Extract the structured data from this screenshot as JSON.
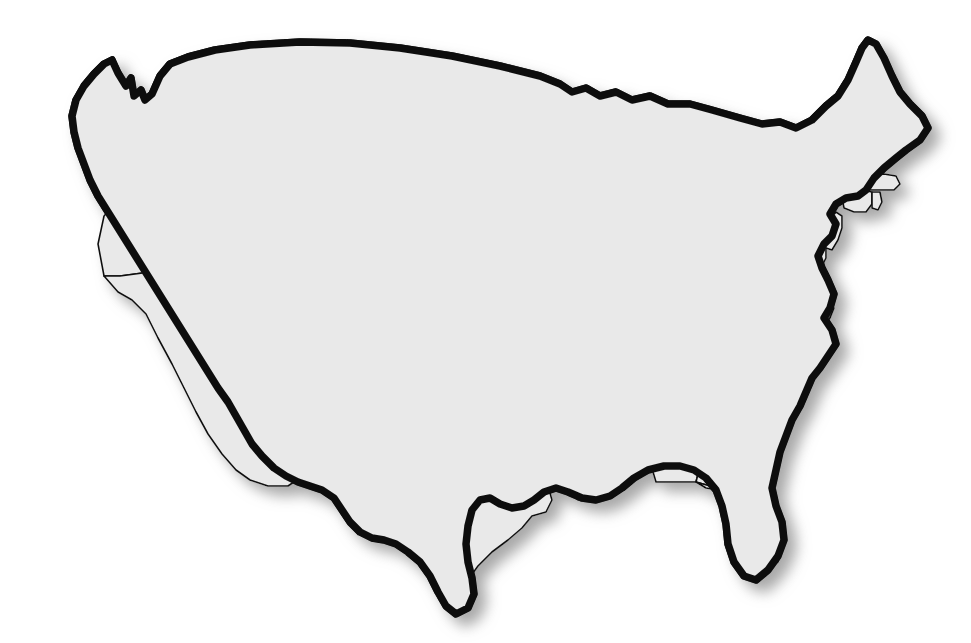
{
  "figure": {
    "kind": "choropleth-locator-map",
    "region": "Contiguous United States",
    "background_color": "#ffffff",
    "width": 971,
    "height": 643,
    "has_title": false,
    "has_legend": false,
    "has_labels": false,
    "title": "",
    "caption": ""
  },
  "style": {
    "state_fill": "#e9e9e9",
    "highlight_fill": "#6a6a6a",
    "lake_fill": "#bdbdbd",
    "border_color": "#111111",
    "outline_color": "#111111",
    "shadow_color": "#9a9a9a",
    "internal_border_width": 1.6,
    "national_border_width": 7.5,
    "shadow_offset_x": 9,
    "shadow_offset_y": 9,
    "shadow_blur": 7
  },
  "highlight": {
    "state_code": "VA",
    "state_name": "Virginia",
    "fill": "#6a6a6a"
  },
  "lakes": [
    {
      "code": "LK-SUPERIOR",
      "name": "Lake Superior"
    },
    {
      "code": "LK-MICHIGAN",
      "name": "Lake Michigan"
    },
    {
      "code": "LK-HURON",
      "name": "Lake Huron"
    },
    {
      "code": "LK-ERIE",
      "name": "Lake Erie"
    },
    {
      "code": "LK-ONTARIO",
      "name": "Lake Ontario"
    }
  ],
  "states": [
    {
      "code": "WA",
      "name": "Washington",
      "highlighted": false
    },
    {
      "code": "OR",
      "name": "Oregon",
      "highlighted": false
    },
    {
      "code": "CA",
      "name": "California",
      "highlighted": false
    },
    {
      "code": "NV",
      "name": "Nevada",
      "highlighted": false
    },
    {
      "code": "ID",
      "name": "Idaho",
      "highlighted": false
    },
    {
      "code": "MT",
      "name": "Montana",
      "highlighted": false
    },
    {
      "code": "WY",
      "name": "Wyoming",
      "highlighted": false
    },
    {
      "code": "UT",
      "name": "Utah",
      "highlighted": false
    },
    {
      "code": "AZ",
      "name": "Arizona",
      "highlighted": false
    },
    {
      "code": "NM",
      "name": "New Mexico",
      "highlighted": false
    },
    {
      "code": "CO",
      "name": "Colorado",
      "highlighted": false
    },
    {
      "code": "ND",
      "name": "North Dakota",
      "highlighted": false
    },
    {
      "code": "SD",
      "name": "South Dakota",
      "highlighted": false
    },
    {
      "code": "NE",
      "name": "Nebraska",
      "highlighted": false
    },
    {
      "code": "KS",
      "name": "Kansas",
      "highlighted": false
    },
    {
      "code": "OK",
      "name": "Oklahoma",
      "highlighted": false
    },
    {
      "code": "TX",
      "name": "Texas",
      "highlighted": false
    },
    {
      "code": "MN",
      "name": "Minnesota",
      "highlighted": false
    },
    {
      "code": "IA",
      "name": "Iowa",
      "highlighted": false
    },
    {
      "code": "MO",
      "name": "Missouri",
      "highlighted": false
    },
    {
      "code": "AR",
      "name": "Arkansas",
      "highlighted": false
    },
    {
      "code": "LA",
      "name": "Louisiana",
      "highlighted": false
    },
    {
      "code": "WI",
      "name": "Wisconsin",
      "highlighted": false
    },
    {
      "code": "IL",
      "name": "Illinois",
      "highlighted": false
    },
    {
      "code": "MI",
      "name": "Michigan",
      "highlighted": false
    },
    {
      "code": "IN",
      "name": "Indiana",
      "highlighted": false
    },
    {
      "code": "OH",
      "name": "Ohio",
      "highlighted": false
    },
    {
      "code": "KY",
      "name": "Kentucky",
      "highlighted": false
    },
    {
      "code": "TN",
      "name": "Tennessee",
      "highlighted": false
    },
    {
      "code": "MS",
      "name": "Mississippi",
      "highlighted": false
    },
    {
      "code": "AL",
      "name": "Alabama",
      "highlighted": false
    },
    {
      "code": "GA",
      "name": "Georgia",
      "highlighted": false
    },
    {
      "code": "FL",
      "name": "Florida",
      "highlighted": false
    },
    {
      "code": "SC",
      "name": "South Carolina",
      "highlighted": false
    },
    {
      "code": "NC",
      "name": "North Carolina",
      "highlighted": false
    },
    {
      "code": "VA",
      "name": "Virginia",
      "highlighted": true
    },
    {
      "code": "WV",
      "name": "West Virginia",
      "highlighted": false
    },
    {
      "code": "MD",
      "name": "Maryland",
      "highlighted": false
    },
    {
      "code": "DE",
      "name": "Delaware",
      "highlighted": false
    },
    {
      "code": "PA",
      "name": "Pennsylvania",
      "highlighted": false
    },
    {
      "code": "NJ",
      "name": "New Jersey",
      "highlighted": false
    },
    {
      "code": "NY",
      "name": "New York",
      "highlighted": false
    },
    {
      "code": "CT",
      "name": "Connecticut",
      "highlighted": false
    },
    {
      "code": "RI",
      "name": "Rhode Island",
      "highlighted": false
    },
    {
      "code": "MA",
      "name": "Massachusetts",
      "highlighted": false
    },
    {
      "code": "VT",
      "name": "Vermont",
      "highlighted": false
    },
    {
      "code": "NH",
      "name": "New Hampshire",
      "highlighted": false
    },
    {
      "code": "ME",
      "name": "Maine",
      "highlighted": false
    }
  ]
}
